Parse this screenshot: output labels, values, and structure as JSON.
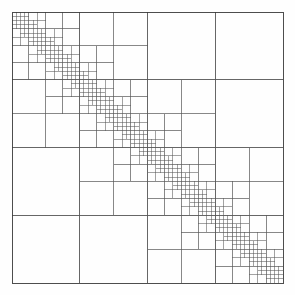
{
  "figure": {
    "type": "h-matrix-block-structure",
    "canvas_width": 295,
    "canvas_height": 295,
    "background_color": "#fefefe"
  },
  "matrix": {
    "label": "hierarchical-matrix",
    "origin_x": 12,
    "origin_y": 12,
    "size": 271,
    "border_color": "#3a3a3a",
    "border_width": 0.9,
    "grid_color": "#555555",
    "dense_block_color": "#111111",
    "empty_block_color": "#ffffff",
    "admissible_label": "admissible (low-rank) block",
    "inadmissible_label": "inadmissible (dense) block"
  },
  "chart_data": {
    "type": "heatmap",
    "subtitle": "",
    "xlabel": "",
    "ylabel": "",
    "grid": true,
    "legend": "none",
    "n": 256,
    "min_leaf": 4,
    "admissibility_eta": 1.0,
    "root": {
      "x": 0,
      "y": 0,
      "size": 256,
      "split_ratio": 0.5
    },
    "levels": 7,
    "diagonal_fill_density": 0.55
  }
}
